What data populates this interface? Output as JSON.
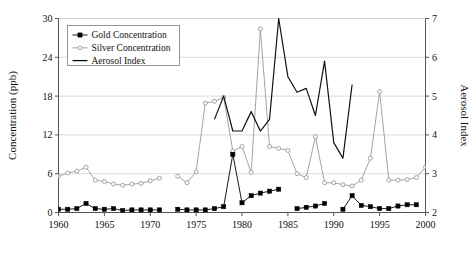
{
  "chart_data": {
    "type": "line",
    "title": "",
    "xlabel": "",
    "ylabel": "Concentration (ppb)",
    "y2label": "Aerosol Index",
    "xlim": [
      1960,
      2000
    ],
    "ylim": [
      0,
      30
    ],
    "y2lim": [
      2,
      7
    ],
    "xticks": [
      1960,
      1965,
      1970,
      1975,
      1980,
      1985,
      1990,
      1995,
      2000
    ],
    "yticks": [
      0,
      6,
      12,
      18,
      24,
      30
    ],
    "y2ticks": [
      2,
      3,
      4,
      5,
      6,
      7
    ],
    "grid": "horizontal",
    "legend_position": "top-left",
    "legend": [
      "Gold Concentration",
      "Silver Concentration",
      "Aerosol Index"
    ],
    "colors": {
      "gold": "#000000",
      "silver": "#9a9a9a",
      "aerosol": "#111111",
      "grid": "#cfcfcf",
      "axis": "#555555",
      "background": "#ffffff"
    },
    "series": [
      {
        "name": "Gold Concentration",
        "axis": "left",
        "marker": "filled-square",
        "x": [
          1960,
          1961,
          1962,
          1963,
          1964,
          1965,
          1966,
          1967,
          1968,
          1969,
          1970,
          1971,
          1973,
          1974,
          1975,
          1976,
          1977,
          1978,
          1979,
          1980,
          1981,
          1982,
          1983,
          1984,
          1986,
          1987,
          1988,
          1989,
          1991,
          1992,
          1993,
          1994,
          1995,
          1996,
          1997,
          1998,
          1999
        ],
        "values": [
          0.5,
          0.5,
          0.6,
          1.4,
          0.6,
          0.5,
          0.6,
          0.3,
          0.4,
          0.4,
          0.4,
          0.4,
          0.5,
          0.4,
          0.4,
          0.4,
          0.6,
          0.9,
          9.0,
          1.5,
          2.6,
          3.0,
          3.3,
          3.6,
          0.6,
          0.8,
          1.0,
          1.4,
          0.5,
          2.6,
          1.1,
          0.9,
          0.6,
          0.6,
          1.0,
          1.2,
          1.2
        ]
      },
      {
        "name": "Silver Concentration",
        "axis": "left",
        "marker": "open-circle",
        "x": [
          1960,
          1961,
          1962,
          1963,
          1964,
          1965,
          1966,
          1967,
          1968,
          1969,
          1970,
          1971,
          1973,
          1974,
          1975,
          1976,
          1977,
          1978,
          1979,
          1980,
          1981,
          1982,
          1983,
          1984,
          1985,
          1986,
          1987,
          1988,
          1989,
          1990,
          1991,
          1992,
          1993,
          1994,
          1995,
          1996,
          1997,
          1998,
          1999,
          2000
        ],
        "values": [
          5.6,
          6.1,
          6.4,
          7.0,
          5.0,
          4.8,
          4.4,
          4.2,
          4.4,
          4.5,
          4.9,
          5.3,
          5.6,
          4.6,
          6.3,
          16.9,
          17.2,
          17.8,
          9.5,
          10.2,
          6.2,
          28.4,
          10.2,
          9.9,
          9.6,
          6.0,
          5.4,
          11.7,
          4.6,
          4.6,
          4.3,
          4.1,
          5.0,
          8.4,
          18.7,
          5.0,
          5.0,
          5.1,
          5.4,
          7.0
        ]
      },
      {
        "name": "Aerosol Index",
        "axis": "right",
        "marker": "none",
        "x": [
          1977,
          1978,
          1979,
          1980,
          1981,
          1982,
          1983,
          1984,
          1985,
          1986,
          1987,
          1988,
          1989,
          1990,
          1991,
          1992
        ],
        "values": [
          4.4,
          5.0,
          4.1,
          4.1,
          4.6,
          4.1,
          4.4,
          7.0,
          5.5,
          5.1,
          5.2,
          4.5,
          5.9,
          3.8,
          3.4,
          5.3
        ]
      }
    ]
  }
}
